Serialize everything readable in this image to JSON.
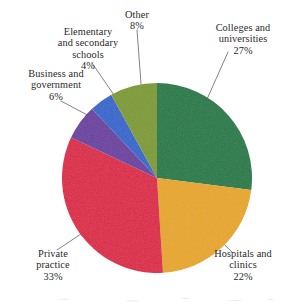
{
  "chart_data": {
    "type": "pie",
    "title": "",
    "subtitle": "",
    "xlabel": "",
    "ylabel": "",
    "legend_position": "none",
    "grid": false,
    "labels_outside": true,
    "leader_lines": true,
    "start_angle_deg": 0,
    "direction": "clockwise",
    "categories": [
      "Colleges and universities",
      "Hospitals and clinics",
      "Private practice",
      "Business and government",
      "Elementary and secondary schools",
      "Other"
    ],
    "values": [
      27,
      22,
      33,
      6,
      4,
      8
    ],
    "value_unit": "%",
    "colors": [
      "#1f7a47",
      "#e8a723",
      "#dc2347",
      "#6b3fa0",
      "#3366cc",
      "#7d9b30"
    ],
    "slices": [
      {
        "name": "Colleges and universities",
        "value": 27,
        "percent_text": "27%",
        "color": "#1f7a47",
        "label_line1": "Colleges and",
        "label_line2": "universities"
      },
      {
        "name": "Hospitals and clinics",
        "value": 22,
        "percent_text": "22%",
        "color": "#e8a723",
        "label_line1": "Hospitals and",
        "label_line2": "clinics"
      },
      {
        "name": "Private practice",
        "value": 33,
        "percent_text": "33%",
        "color": "#dc2347",
        "label_line1": "Private",
        "label_line2": "practice"
      },
      {
        "name": "Business and government",
        "value": 6,
        "percent_text": "6%",
        "color": "#6b3fa0",
        "label_line1": "Business and",
        "label_line2": "government"
      },
      {
        "name": "Elementary and secondary schools",
        "value": 4,
        "percent_text": "4%",
        "color": "#3366cc",
        "label_line1": "Elementary",
        "label_line2": "and secondary",
        "label_line3": "schools"
      },
      {
        "name": "Other",
        "value": 8,
        "percent_text": "8%",
        "color": "#7d9b30",
        "label_line1": "Other",
        "label_line2": ""
      }
    ]
  },
  "labels": {
    "other": {
      "line1": "Other",
      "pct": "8%"
    },
    "elementary": {
      "line1": "Elementary",
      "line2": "and secondary",
      "line3": "schools",
      "pct": "4%"
    },
    "business": {
      "line1": "Business and",
      "line2": "government",
      "pct": "6%"
    },
    "private": {
      "line1": "Private",
      "line2": "practice",
      "pct": "33%"
    },
    "colleges": {
      "line1": "Colleges and",
      "line2": "universities",
      "pct": "27%"
    },
    "hospitals": {
      "line1": "Hospitals and",
      "line2": "clinics",
      "pct": "22%"
    }
  },
  "style": {
    "background": "#ffffff",
    "text_color": "#29292b",
    "leader_line_color": "#6d6d70"
  }
}
